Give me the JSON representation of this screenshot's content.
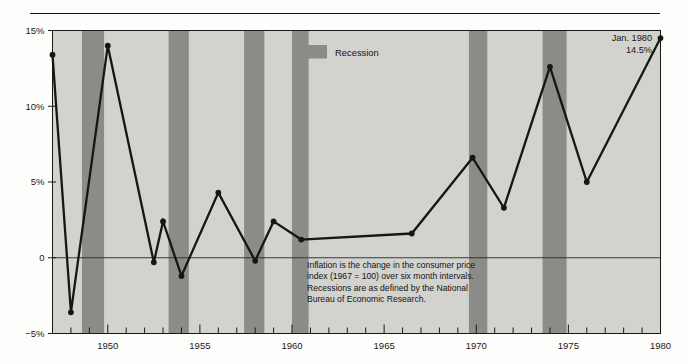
{
  "figure": {
    "background_color": "#fdfdfb",
    "rule_color": "#15130f"
  },
  "chart_data": {
    "type": "line",
    "title": "",
    "subtitle": "",
    "xlabel": "",
    "ylabel": "",
    "xlim": [
      1947.0,
      1980.0
    ],
    "ylim": [
      -5,
      15
    ],
    "yticks": [
      -5,
      0,
      5,
      10,
      15
    ],
    "ytick_labels": [
      "−5%",
      "0",
      "5%",
      "10%",
      "15%"
    ],
    "xticks": [
      1950,
      1955,
      1960,
      1965,
      1970,
      1975,
      1980
    ],
    "xtick_labels": [
      "1950",
      "1955",
      "1960",
      "1965",
      "1970",
      "1975",
      "1980"
    ],
    "minor_xtick_interval": 1,
    "grid": false,
    "zero_line": true,
    "plot_bg_color": "#d2d2cf",
    "band_color": "#8b8b88",
    "line_color": "#181614",
    "marker": "circle",
    "series": [
      {
        "name": "Inflation (CPI, 6-month intervals, annualized)",
        "x": [
          1947.0,
          1948.0,
          1950.0,
          1952.5,
          1953.0,
          1954.0,
          1956.0,
          1958.0,
          1959.0,
          1960.5,
          1966.5,
          1969.8,
          1971.5,
          1974.0,
          1976.0,
          1980.0
        ],
        "values": [
          13.4,
          -3.6,
          14.0,
          -0.3,
          2.4,
          -1.2,
          4.3,
          -0.2,
          2.4,
          1.2,
          1.6,
          6.6,
          3.3,
          12.6,
          5.0,
          14.5
        ]
      }
    ],
    "recession_bands": [
      {
        "start": 1948.6,
        "end": 1949.8
      },
      {
        "start": 1953.3,
        "end": 1954.4
      },
      {
        "start": 1957.4,
        "end": 1958.5
      },
      {
        "start": 1960.0,
        "end": 1960.9
      },
      {
        "start": 1969.6,
        "end": 1970.6
      },
      {
        "start": 1973.6,
        "end": 1974.9
      }
    ],
    "legend": {
      "position": "inside-top-right",
      "entries": [
        {
          "label": "Recession",
          "color": "#8b8b88",
          "swatch": "rect"
        }
      ]
    },
    "annotations": [
      {
        "name": "methodology-note",
        "lines": [
          "Inflation is the change in the consumer price",
          "index (1967 = 100) over six month intervals.",
          "Recessions are as defined by the National",
          "Bureau of Economic Research."
        ]
      },
      {
        "name": "last-point-callout",
        "lines": [
          "Jan. 1980",
          "14.5%"
        ],
        "x": 1980.0,
        "y": 14.5
      }
    ]
  }
}
